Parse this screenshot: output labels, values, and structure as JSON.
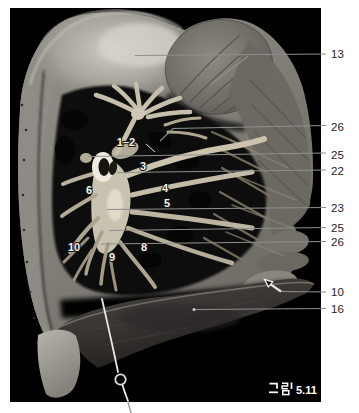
{
  "figure": {
    "caption_full": "그림 5.11",
    "caption_korean": "그림",
    "caption_number": "5.11"
  },
  "right_labels": [
    {
      "text": "13"
    },
    {
      "text": "26"
    },
    {
      "text": "25"
    },
    {
      "text": "22"
    },
    {
      "text": "23"
    },
    {
      "text": "25"
    },
    {
      "text": "26"
    },
    {
      "text": "10"
    },
    {
      "text": "16"
    }
  ],
  "specimen_labels": [
    {
      "text": "1–2"
    },
    {
      "text": "3"
    },
    {
      "text": "4"
    },
    {
      "text": "5"
    },
    {
      "text": "6"
    },
    {
      "text": "10"
    },
    {
      "text": "9"
    },
    {
      "text": "8"
    }
  ],
  "colors": {
    "page_background": "#ffffff",
    "photo_background": "#000000",
    "leader_line": "#8f8f8f",
    "right_label_text": "#1e1e1e",
    "specimen_label_text": "#f2f1ec",
    "caption_text": "#ffffff"
  }
}
